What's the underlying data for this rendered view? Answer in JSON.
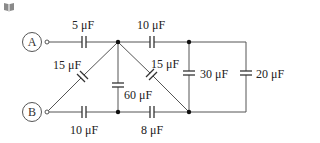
{
  "icon": "book-icon",
  "terminals": {
    "a": "A",
    "b": "B"
  },
  "capacitors": {
    "top_left": "5 μF",
    "top_right": "10 μF",
    "diag_left": "15 μF",
    "middle_vertical": "60 μF",
    "diag_right": "15 μF",
    "right_inner": "30 μF",
    "right_outer": "20 μF",
    "bottom_left": "10 μF",
    "bottom_right": "8 μF"
  },
  "colors": {
    "wire": "#555555",
    "text": "#222222",
    "icon": "#8a8a8a"
  }
}
